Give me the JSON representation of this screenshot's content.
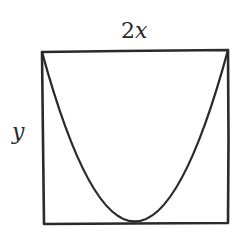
{
  "figure": {
    "type": "geometry-diagram",
    "labels": {
      "width_coefficient": "2",
      "width_variable": "x",
      "height_variable": "y"
    },
    "colors": {
      "stroke": "#2a2a2a",
      "background": "#ffffff"
    },
    "rectangle": {
      "top_left": [
        42,
        52
      ],
      "top_right": [
        228,
        50
      ],
      "bottom_right": [
        228,
        223
      ],
      "bottom_left": [
        44,
        224
      ]
    },
    "parabola": {
      "start": [
        42,
        52
      ],
      "vertex": [
        133,
        222
      ],
      "end": [
        228,
        50
      ]
    }
  }
}
